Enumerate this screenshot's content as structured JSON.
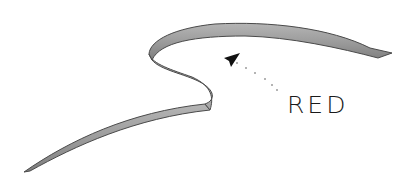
{
  "illustration": {
    "subject": "ribbon-stroke",
    "ribbon_color": "#9a9a9a",
    "ribbon_edge_color": "#4a4a4a",
    "annotation": {
      "label": "RED",
      "arrow_color": "#111111"
    }
  }
}
